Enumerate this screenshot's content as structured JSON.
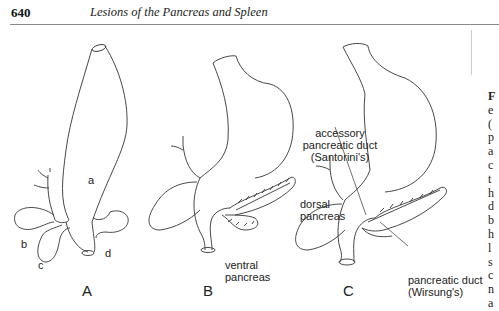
{
  "header": {
    "page_number": "640",
    "running_title": "Lesions of the Pancreas and Spleen"
  },
  "figure": {
    "panels": [
      {
        "id": "A",
        "label": "A",
        "part_labels": [
          "a",
          "b",
          "c",
          "d"
        ]
      },
      {
        "id": "B",
        "label": "B",
        "annotations": {
          "dorsal": "dorsal\npancreas",
          "ventral": "ventral\npancreas"
        }
      },
      {
        "id": "C",
        "label": "C",
        "annotations": {
          "accessory": "accessory\npancreatic duct\n(Santorini's)",
          "main": "pancreatic duct\n(Wirsung's)"
        }
      }
    ],
    "panel_a": {
      "a": "a",
      "b": "b",
      "c": "c",
      "d": "d",
      "label": "A"
    },
    "panel_b": {
      "dorsal_line1": "dorsal",
      "dorsal_line2": "pancreas",
      "ventral_line1": "ventral",
      "ventral_line2": "pancreas",
      "label": "B"
    },
    "panel_c": {
      "acc_line1": "accessory",
      "acc_line2": "pancreatic duct",
      "acc_line3": "(Santorini's)",
      "main_line1": "pancreatic duct",
      "main_line2": "(Wirsung's)",
      "label": "C"
    }
  },
  "side_text_fragments": [
    "F",
    "e",
    "(",
    "p",
    "a",
    "c",
    "t",
    "h",
    "d",
    "b",
    "h",
    "l",
    "s",
    "c",
    "n",
    "a"
  ]
}
